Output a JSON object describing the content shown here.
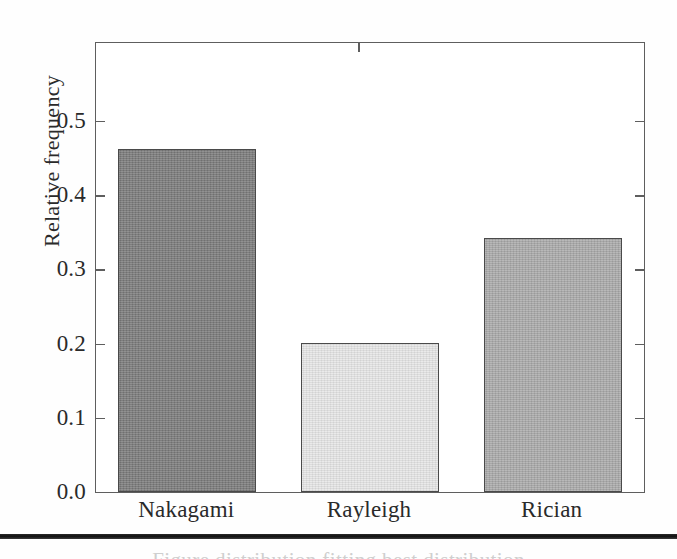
{
  "chart_data": {
    "type": "bar",
    "title": "",
    "subtitle": "",
    "xlabel": "",
    "ylabel": "Relative frequency",
    "categories": [
      "Nakagami",
      "Rayleigh",
      "Rician"
    ],
    "values": [
      0.462,
      0.201,
      0.342
    ],
    "series": [
      {
        "name": "Relative frequency",
        "values": [
          0.462,
          0.201,
          0.342
        ]
      }
    ],
    "bar_colors": [
      "#7b7b7b",
      "#e6e6e6",
      "#a9a9a9"
    ],
    "bar_edge_color": "#4a4a4a",
    "ylim": [
      0.0,
      0.605
    ],
    "xlim": [
      0,
      3
    ],
    "ytick_labels": [
      "0.0",
      "0.1",
      "0.2",
      "0.3",
      "0.4",
      "0.5"
    ],
    "ytick_values": [
      0.0,
      0.1,
      0.2,
      0.3,
      0.4,
      0.5
    ],
    "grid": false,
    "legend": "none",
    "legend_position": "none",
    "annotations": [],
    "axis_frame": "full-box",
    "tick_direction": "in",
    "frame_color": "#5e5e5e",
    "background_color": "#ffffff"
  },
  "page": {
    "rule_color": "#141414",
    "caption_remnant": "Figure  distribution  fitting  best distribution"
  }
}
